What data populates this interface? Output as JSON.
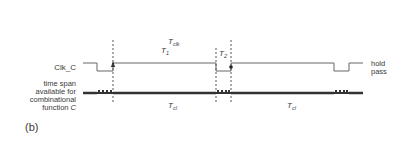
{
  "figure": {
    "panel_label": "(b)",
    "signal_label": "Clk_C",
    "span_label_lines": [
      "time span",
      "available for",
      "combinational",
      "function C"
    ],
    "span_label_italic_tail": "C",
    "state_labels": {
      "high": "hold",
      "low": "pass"
    },
    "timing_labels": {
      "clock_period": {
        "base": "T",
        "sub": "clk"
      },
      "phase_1": {
        "base": "T",
        "sub": "1"
      },
      "phase_2": {
        "base": "T",
        "sub": "2"
      },
      "comb_span_1": {
        "base": "T",
        "sub": "cl"
      },
      "comb_span_2": {
        "base": "T",
        "sub": "cl"
      }
    },
    "colors": {
      "line": "#555555",
      "thick": "#333333",
      "text": "#3a3a3a"
    }
  }
}
